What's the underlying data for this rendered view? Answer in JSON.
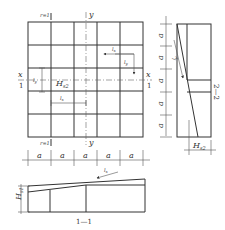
{
  "plan": {
    "top_section_label": "r=1",
    "bottom_section_label": "r=1",
    "axis_y_top": "y",
    "axis_y_bottom": "y",
    "axis_x_left": "x",
    "axis_x_right": "x",
    "section_left": "1",
    "section_right": "1",
    "label_H": "H",
    "label_H_sub": "s2",
    "label_ly": "l",
    "label_ly_sub": "y",
    "label_lx": "l",
    "label_lx_sub": "x",
    "arrow_lx_label": "l",
    "arrow_lx_sub": "x",
    "arrow_ly_label": "l",
    "arrow_ly_sub": "y",
    "spacing_labels": [
      "a",
      "a",
      "a",
      "a",
      "a"
    ]
  },
  "section_2_2": {
    "title": "2—2",
    "spacing_labels": [
      "a",
      "a",
      "a",
      "a",
      "a"
    ],
    "slope_label": "l",
    "slope_sub": "y",
    "height_label": "H",
    "height_sub": "s2"
  },
  "section_1_1": {
    "title": "1—1",
    "height_label": "H",
    "height_sub": "s1",
    "slope_label": "l",
    "slope_sub": "x"
  }
}
